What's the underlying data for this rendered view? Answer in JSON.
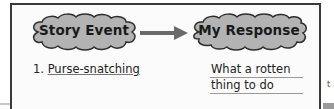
{
  "diagram": {
    "type": "graphic-organizer",
    "nodes": [
      {
        "id": "story-event",
        "label": "Story Event",
        "shape": "cloud"
      },
      {
        "id": "my-response",
        "label": "My Response",
        "shape": "cloud"
      }
    ],
    "edges": [
      {
        "from": "story-event",
        "to": "my-response",
        "style": "arrow"
      }
    ],
    "entries": {
      "event_number": "1.",
      "event_text": "Purse-snatching",
      "response_lines": [
        "What a rotten",
        "thing to do"
      ]
    },
    "stray_text": "t"
  },
  "colors": {
    "cloud_fill": "#b3b3b3",
    "cloud_outline": "#2e2e2e",
    "arrow": "#6a6a6a",
    "frame": "#3a3a3a"
  }
}
